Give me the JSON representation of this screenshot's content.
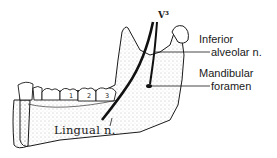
{
  "figure": {
    "labels": {
      "v3": "V³",
      "inferior_alveolar": [
        "Inferior",
        "alveolar n."
      ],
      "mandibular_foramen": [
        "Mandibular",
        "foramen"
      ],
      "lingual": "Lingual n."
    },
    "tooth_numbers": [
      "1",
      "2",
      "3"
    ],
    "colors": {
      "ink": "#1a1a1a",
      "stipple": "#7a7a7a",
      "background": "#ffffff"
    }
  }
}
